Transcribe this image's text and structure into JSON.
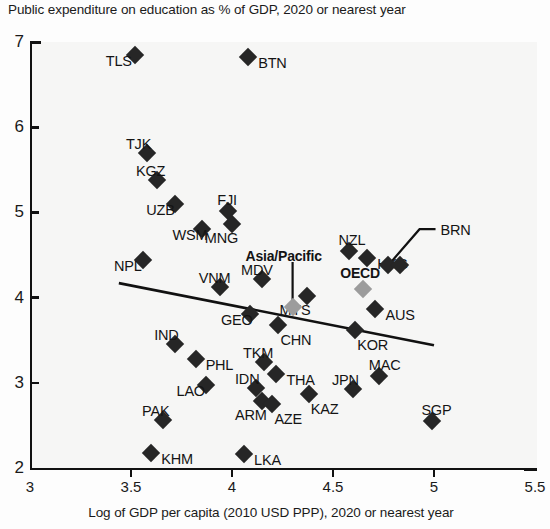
{
  "chart_data": {
    "type": "scatter",
    "title": "Public expenditure on education as % of GDP, 2020 or nearest year",
    "xlabel": "Log of GDP per capita (2010 USD PPP), 2020 or nearest year",
    "ylabel": "",
    "xlim": [
      3,
      5.5
    ],
    "ylim": [
      2,
      7
    ],
    "xticks": [
      "3",
      "3.5",
      "4",
      "4.5",
      "5",
      "5.5"
    ],
    "yticks": [
      "2",
      "3",
      "4",
      "5",
      "6",
      "7"
    ],
    "grid": false,
    "legend": "none",
    "marker_color": "#262626",
    "aggregate_color": "#9c9c9c",
    "trendline": {
      "present": true,
      "x_start": 3.44,
      "y_start": 4.17,
      "x_end": 5.0,
      "y_end": 3.44,
      "color": "#111111"
    },
    "annotations": [
      {
        "label": "Asia/Pacific",
        "bold": true,
        "leader_line": true
      },
      {
        "label": "OECD",
        "bold": true,
        "leader_line": false
      },
      {
        "label": "BRN",
        "bold": false,
        "leader_line": true
      }
    ],
    "points": [
      {
        "label": "TLS",
        "x": 3.52,
        "y": 6.85,
        "label_pos": "left",
        "type": "country"
      },
      {
        "label": "BTN",
        "x": 4.08,
        "y": 6.82,
        "label_pos": "right",
        "type": "country"
      },
      {
        "label": "TJK",
        "x": 3.58,
        "y": 5.7,
        "label_pos": "above-left",
        "type": "country"
      },
      {
        "label": "KGZ",
        "x": 3.63,
        "y": 5.38,
        "label_pos": "above-left",
        "type": "country"
      },
      {
        "label": "UZB",
        "x": 3.72,
        "y": 5.1,
        "label_pos": "left",
        "type": "country"
      },
      {
        "label": "FJI",
        "x": 3.98,
        "y": 5.02,
        "label_pos": "above",
        "type": "country"
      },
      {
        "label": "MNG",
        "x": 4.0,
        "y": 4.86,
        "label_pos": "below-left",
        "type": "country"
      },
      {
        "label": "WSM",
        "x": 3.85,
        "y": 4.8,
        "label_pos": "left",
        "type": "country"
      },
      {
        "label": "NZL",
        "x": 4.58,
        "y": 4.55,
        "label_pos": "above",
        "type": "country"
      },
      {
        "label": "HKG",
        "x": 4.67,
        "y": 4.47,
        "label_pos": "right",
        "type": "country"
      },
      {
        "label": "BRN",
        "x": 4.77,
        "y": 4.38,
        "label_pos": "leader",
        "type": "country"
      },
      {
        "label": "BRN2",
        "x": 4.83,
        "y": 4.38,
        "label_pos": "none",
        "type": "country"
      },
      {
        "label": "NPL",
        "x": 3.56,
        "y": 4.44,
        "label_pos": "left",
        "type": "country"
      },
      {
        "label": "MDV",
        "x": 4.15,
        "y": 4.22,
        "label_pos": "above-left",
        "type": "country"
      },
      {
        "label": "VNM",
        "x": 3.94,
        "y": 4.12,
        "label_pos": "above-left",
        "type": "country"
      },
      {
        "label": "OECD",
        "x": 4.65,
        "y": 4.1,
        "label_pos": "above-left",
        "type": "aggregate"
      },
      {
        "label": "MYS",
        "x": 4.37,
        "y": 4.02,
        "label_pos": "below-left",
        "type": "country"
      },
      {
        "label": "Asia/Pacific",
        "x": 4.3,
        "y": 3.89,
        "label_pos": "leader",
        "type": "aggregate"
      },
      {
        "label": "AUS",
        "x": 4.71,
        "y": 3.87,
        "label_pos": "right",
        "type": "country"
      },
      {
        "label": "GEO",
        "x": 4.09,
        "y": 3.81,
        "label_pos": "left",
        "type": "country"
      },
      {
        "label": "CHN",
        "x": 4.23,
        "y": 3.68,
        "label_pos": "below-right",
        "type": "country"
      },
      {
        "label": "KOR",
        "x": 4.61,
        "y": 3.62,
        "label_pos": "below-right",
        "type": "country"
      },
      {
        "label": "IND",
        "x": 3.72,
        "y": 3.45,
        "label_pos": "above-left",
        "type": "country"
      },
      {
        "label": "PHL",
        "x": 3.82,
        "y": 3.28,
        "label_pos": "right",
        "type": "country"
      },
      {
        "label": "TKM",
        "x": 4.16,
        "y": 3.25,
        "label_pos": "above-left",
        "type": "country"
      },
      {
        "label": "MAC",
        "x": 4.73,
        "y": 3.08,
        "label_pos": "above",
        "type": "country"
      },
      {
        "label": "THA",
        "x": 4.22,
        "y": 3.1,
        "label_pos": "right",
        "type": "country"
      },
      {
        "label": "IDN",
        "x": 4.12,
        "y": 2.94,
        "label_pos": "above-left",
        "type": "country"
      },
      {
        "label": "LAO",
        "x": 3.87,
        "y": 2.97,
        "label_pos": "left",
        "type": "country"
      },
      {
        "label": "JPN",
        "x": 4.6,
        "y": 2.93,
        "label_pos": "above-left",
        "type": "country"
      },
      {
        "label": "KAZ",
        "x": 4.38,
        "y": 2.87,
        "label_pos": "below-right",
        "type": "country"
      },
      {
        "label": "ARM",
        "x": 4.15,
        "y": 2.79,
        "label_pos": "below-left",
        "type": "country"
      },
      {
        "label": "AZE",
        "x": 4.2,
        "y": 2.75,
        "label_pos": "below-right",
        "type": "country"
      },
      {
        "label": "PAK",
        "x": 3.66,
        "y": 2.56,
        "label_pos": "above-left",
        "type": "country"
      },
      {
        "label": "SGP",
        "x": 4.99,
        "y": 2.55,
        "label_pos": "above",
        "type": "country"
      },
      {
        "label": "KHM",
        "x": 3.6,
        "y": 2.18,
        "label_pos": "right",
        "type": "country"
      },
      {
        "label": "LKA",
        "x": 4.06,
        "y": 2.17,
        "label_pos": "right",
        "type": "country"
      }
    ]
  }
}
